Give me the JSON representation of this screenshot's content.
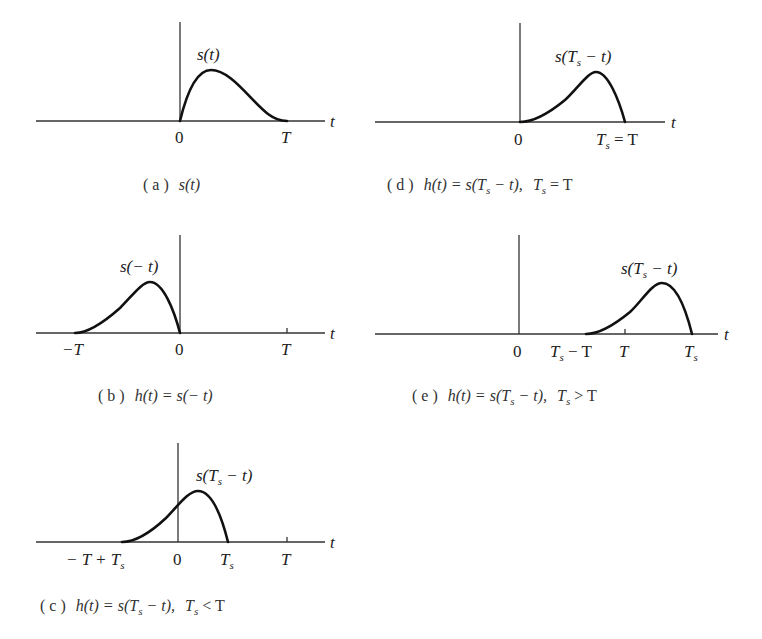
{
  "figure": {
    "panels": [
      {
        "id": "a",
        "caption": "( a )  s(t)",
        "curve_label": "s(t)",
        "axis_var": "t",
        "tick_labels": [
          "0",
          "T"
        ]
      },
      {
        "id": "b",
        "caption": "( b )  h(t) = s(−t)",
        "curve_label": "s(−t)",
        "axis_var": "t",
        "tick_labels": [
          "−T",
          "0",
          "T"
        ]
      },
      {
        "id": "c",
        "caption": "( c )  h(t) = s(Ts−t),  Ts < T",
        "curve_label": "s(Ts−t)",
        "axis_var": "t",
        "tick_labels": [
          "−T + Ts",
          "0",
          "Ts",
          "T"
        ]
      },
      {
        "id": "d",
        "caption": "( d )  h(t) = s(Ts−t),  Ts = T",
        "curve_label": "s(Ts−t)",
        "axis_var": "t",
        "tick_labels": [
          "0",
          "Ts = T"
        ]
      },
      {
        "id": "e",
        "caption": "( e )  h(t) = s(Ts−t),  Ts > T",
        "curve_label": "s(Ts−t)",
        "axis_var": "t",
        "tick_labels": [
          "0",
          "Ts − T",
          "T",
          "Ts"
        ]
      }
    ],
    "text": {
      "a_cap_prefix": "( a )",
      "a_cap_expr": "s(t)",
      "b_cap_prefix": "( b )",
      "b_cap_expr": "h(t) = s(− t)",
      "c_cap_prefix": "( c )",
      "d_cap_prefix": "( d )",
      "e_cap_prefix": "( e )",
      "h_eq_s": "h(t) = s(T",
      "minus_t_close": " − t),",
      "s_open": "s(T",
      "s_close": " − t)",
      "s_t": "s(t)",
      "s_neg_t": "s(− t)",
      "t": "t",
      "zero": "0",
      "T": "T",
      "negT": "−T",
      "sub_s": "s",
      "T_space": "T",
      "eq_T": " = T",
      "lt_T": " < T",
      "gt_T": " > T",
      "minus_T": " − T",
      "negT_plus": "− T + T"
    }
  }
}
